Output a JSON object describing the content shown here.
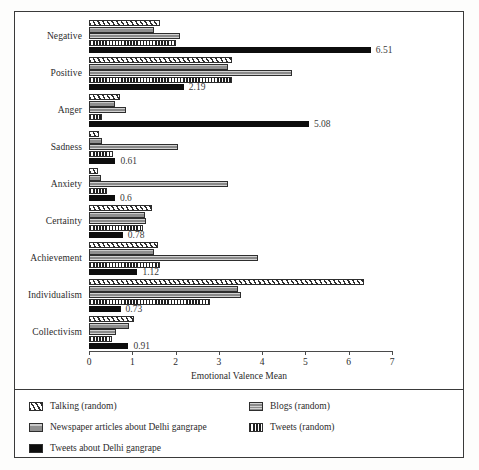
{
  "chart_data": {
    "type": "bar",
    "orientation": "horizontal",
    "title": "",
    "xlabel": "Emotional Valence Mean",
    "ylabel": "",
    "xlim": [
      0,
      7
    ],
    "xticks": [
      "0",
      "1",
      "2",
      "3",
      "4",
      "5",
      "6",
      "7"
    ],
    "grid": false,
    "legend_position": "bottom",
    "categories": [
      "Negative",
      "Positive",
      "Anger",
      "Sadness",
      "Anxiety",
      "Certainty",
      "Achievement",
      "Individualism",
      "Collectivism"
    ],
    "series": [
      {
        "name": "Talking (random)",
        "key": "talking",
        "pattern": "diagonal-hatch",
        "color": "#ffffff",
        "values": [
          1.65,
          3.3,
          0.72,
          0.22,
          0.2,
          1.45,
          1.6,
          6.35,
          1.05
        ]
      },
      {
        "name": "Newspaper articles about Delhi gangrape",
        "key": "newspaper",
        "pattern": "solid-gray",
        "color": "#9a9a9a",
        "values": [
          1.5,
          3.2,
          0.6,
          0.3,
          0.28,
          1.3,
          1.5,
          3.45,
          0.92
        ]
      },
      {
        "name": "Blogs (random)",
        "key": "blogs",
        "pattern": "horizontal-lines",
        "color": "#a8a8a8",
        "values": [
          2.1,
          4.7,
          0.85,
          2.05,
          3.2,
          1.32,
          3.9,
          3.5,
          0.62
        ]
      },
      {
        "name": "Tweets (random)",
        "key": "tweets_random",
        "pattern": "vertical-lines",
        "color": "#ffffff",
        "values": [
          2.0,
          3.3,
          0.3,
          0.55,
          0.42,
          1.25,
          1.65,
          2.8,
          0.52
        ]
      },
      {
        "name": "Tweets about Delhi gangrape",
        "key": "tweets_delhi",
        "pattern": "solid-black",
        "color": "#0d0d0d",
        "values": [
          6.51,
          2.19,
          5.08,
          0.61,
          0.6,
          0.78,
          1.12,
          0.73,
          0.91
        ],
        "data_labels": [
          "6.51",
          "2.19",
          "5.08",
          "0.61",
          "0.6",
          "0.78",
          "1.12",
          "0.73",
          "0.91"
        ]
      }
    ]
  },
  "legend": {
    "column_left": [
      {
        "label": "Talking (random)",
        "swatch": "diagonal-hatch"
      },
      {
        "label": "Newspaper articles about Delhi gangrape",
        "swatch": "solid-gray"
      },
      {
        "label": "Tweets about Delhi gangrape",
        "swatch": "solid-black"
      }
    ],
    "column_right": [
      {
        "label": "Blogs (random)",
        "swatch": "horizontal-lines"
      },
      {
        "label": "Tweets (random)",
        "swatch": "vertical-lines"
      }
    ]
  }
}
